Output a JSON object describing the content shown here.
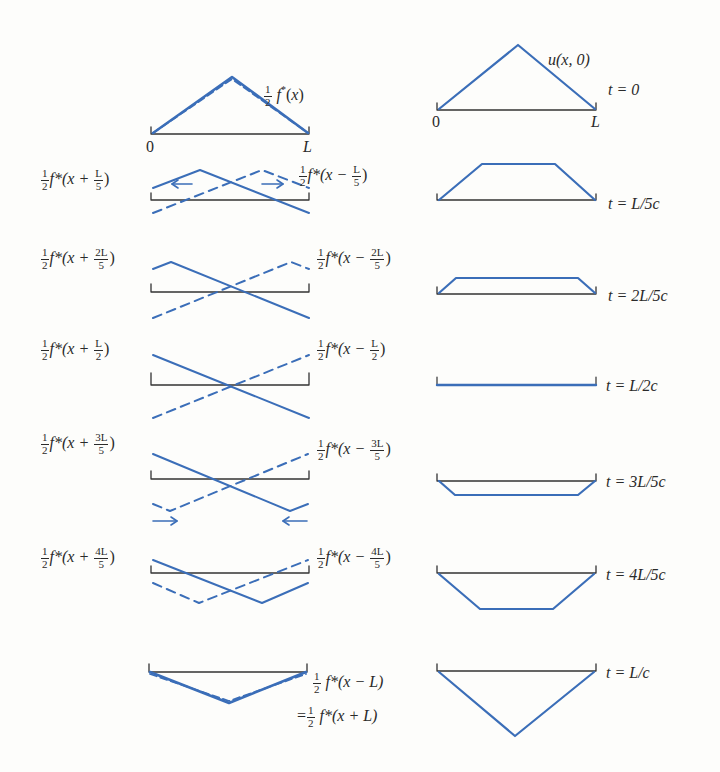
{
  "figure": {
    "colors": {
      "wave": "#3b6eb8",
      "axis": "#333333",
      "background": "#fdfdfb"
    },
    "axis_labels": {
      "zero": "0",
      "L": "L"
    },
    "top_left_label": {
      "coef": "1/2",
      "func": "f*(x)"
    },
    "top_right_label": "u(x, 0)",
    "bottom_equal_prefix": "=",
    "rows": [
      {
        "time": "t = 0",
        "left_plus": null,
        "left_minus": null
      },
      {
        "time": "t = L/5c",
        "left_plus": {
          "text": "f*(x + ",
          "num": "L",
          "den": "5"
        },
        "left_minus": {
          "text": "f*(x − ",
          "num": "L",
          "den": "5"
        }
      },
      {
        "time": "t = 2L/5c",
        "left_plus": {
          "text": "f*(x + ",
          "num": "2L",
          "den": "5"
        },
        "left_minus": {
          "text": "f*(x − ",
          "num": "2L",
          "den": "5"
        }
      },
      {
        "time": "t = L/2c",
        "left_plus": {
          "text": "f*(x + ",
          "num": "L",
          "den": "2"
        },
        "left_minus": {
          "text": "f*(x − ",
          "num": "L",
          "den": "2"
        }
      },
      {
        "time": "t = 3L/5c",
        "left_plus": {
          "text": "f*(x + ",
          "num": "3L",
          "den": "5"
        },
        "left_minus": {
          "text": "f*(x − ",
          "num": "3L",
          "den": "5"
        }
      },
      {
        "time": "t = 4L/5c",
        "left_plus": {
          "text": "f*(x + ",
          "num": "4L",
          "den": "5"
        },
        "left_minus": {
          "text": "f*(x − ",
          "num": "4L",
          "den": "5"
        }
      },
      {
        "time": "t = L/c",
        "left_plus": null,
        "left_minus": null
      }
    ],
    "bottom_labels": {
      "line1": "f*(x − L)",
      "line2": "f*(x + L)"
    }
  }
}
